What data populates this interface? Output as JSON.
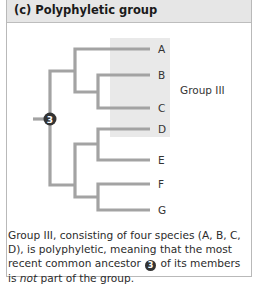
{
  "panel": {
    "title": "(c) Polyphyletic group"
  },
  "tree": {
    "taxa": [
      "A",
      "B",
      "C",
      "D",
      "E",
      "F",
      "G"
    ],
    "ancestor_node_label": "3",
    "group_label": "Group III",
    "group_members": [
      "A",
      "B",
      "C",
      "D"
    ],
    "colors": {
      "branch": "#a3a3a3",
      "highlight": "#e9e9e9",
      "node": "#333333"
    }
  },
  "caption": {
    "part1": "Group III, consisting of four species (A, B, C, D), is polyphyletic, meaning that the most recent common ancestor ",
    "node": "3",
    "part2": " of its members is ",
    "emphasis": "not",
    "part3": " part of the group."
  }
}
